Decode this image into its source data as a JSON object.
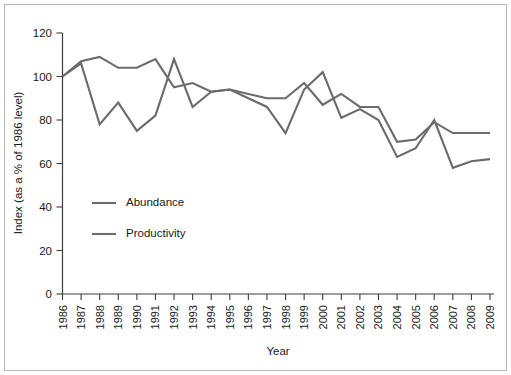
{
  "chart_data": {
    "type": "line",
    "title": "",
    "xlabel": "Year",
    "ylabel": "Index (as a % of 1986 level)",
    "categories": [
      "1986",
      "1987",
      "1988",
      "1989",
      "1990",
      "1991",
      "1992",
      "1993",
      "1994",
      "1995",
      "1996",
      "1997",
      "1998",
      "1999",
      "2000",
      "2001",
      "2002",
      "2003",
      "2004",
      "2005",
      "2006",
      "2007",
      "2008",
      "2009"
    ],
    "x": [
      1986,
      1987,
      1988,
      1989,
      1990,
      1991,
      1992,
      1993,
      1994,
      1995,
      1996,
      1997,
      1998,
      1999,
      2000,
      2001,
      2002,
      2003,
      2004,
      2005,
      2006,
      2007,
      2008,
      2009
    ],
    "ylim": [
      0,
      120
    ],
    "yticks": [
      0,
      20,
      40,
      60,
      80,
      100,
      120
    ],
    "grid": false,
    "legend_position": "inside-lower-left",
    "series": [
      {
        "name": "Abundance",
        "color": "#6b6b6b",
        "values": [
          100,
          107,
          109,
          104,
          104,
          108,
          95,
          97,
          93,
          94,
          92,
          90,
          90,
          97,
          87,
          92,
          86,
          86,
          70,
          71,
          79,
          74,
          74,
          74
        ]
      },
      {
        "name": "Productivity",
        "color": "#6b6b6b",
        "values": [
          100,
          106,
          78,
          88,
          75,
          82,
          108,
          86,
          93,
          94,
          90,
          86,
          74,
          94,
          102,
          81,
          85,
          80,
          63,
          67,
          80,
          58,
          61,
          62
        ]
      }
    ]
  },
  "axes": {
    "y_axis_title": "Index (as a % of 1986 level)",
    "x_axis_title": "Year",
    "y_tick_labels": [
      "0",
      "20",
      "40",
      "60",
      "80",
      "100",
      "120"
    ],
    "x_tick_labels": [
      "1986",
      "1987",
      "1988",
      "1989",
      "1990",
      "1991",
      "1992",
      "1993",
      "1994",
      "1995",
      "1996",
      "1997",
      "1998",
      "1999",
      "2000",
      "2001",
      "2002",
      "2003",
      "2004",
      "2005",
      "2006",
      "2007",
      "2008",
      "2009"
    ]
  },
  "legend": {
    "items": [
      {
        "label": "Abundance"
      },
      {
        "label": "Productivity"
      }
    ]
  },
  "colors": {
    "series_line": "#6b6b6b",
    "axis": "#3c3c3c",
    "text": "#1a1a1a",
    "frame_border": "#b9b9b9",
    "background": "#ffffff"
  }
}
